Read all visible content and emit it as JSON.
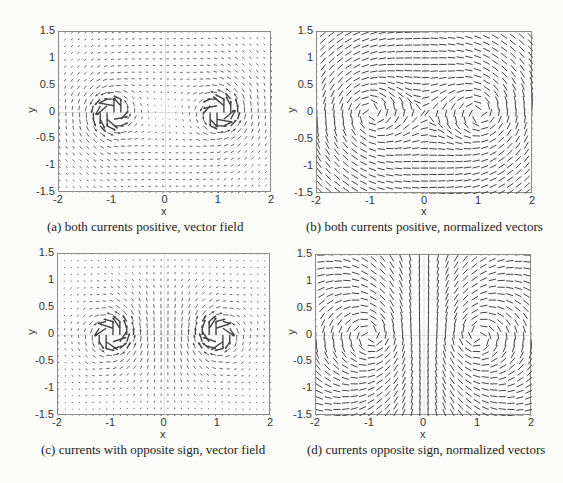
{
  "chart_data": [
    {
      "id": "a",
      "type": "quiver",
      "caption": "(a) both currents positive, vector field",
      "normalized": false,
      "currents": [
        {
          "x": -1,
          "y": 0,
          "sign": 1
        },
        {
          "x": 1,
          "y": 0,
          "sign": 1
        }
      ],
      "xlabel": "x",
      "ylabel": "y",
      "xlim": [
        -2,
        2
      ],
      "ylim": [
        -1.5,
        1.5
      ],
      "xticks": [
        "-2",
        "-1",
        "0",
        "1",
        "2"
      ],
      "yticks": [
        "1.5",
        "1",
        "0.5",
        "0",
        "-0.5",
        "-1",
        "-1.5"
      ],
      "grid": "zero-lines",
      "grid_n": [
        31,
        24
      ],
      "rotation": "counter-clockwise"
    },
    {
      "id": "b",
      "type": "quiver",
      "caption": "(b) both currents positive, normalized vectors",
      "normalized": true,
      "currents": [
        {
          "x": -1,
          "y": 0,
          "sign": 1
        },
        {
          "x": 1,
          "y": 0,
          "sign": 1
        }
      ],
      "xlabel": "x",
      "ylabel": "y",
      "xlim": [
        -2,
        2
      ],
      "ylim": [
        -1.5,
        1.5
      ],
      "xticks": [
        "-2",
        "-1",
        "0",
        "1",
        "2"
      ],
      "yticks": [
        "1.5",
        "1",
        "0.5",
        "0",
        "-0.5",
        "-1",
        "-1.5"
      ],
      "grid": "zero-lines",
      "grid_n": [
        25,
        25
      ],
      "rotation": "counter-clockwise"
    },
    {
      "id": "c",
      "type": "quiver",
      "caption": "(c) currents with opposite sign, vector field",
      "normalized": false,
      "currents": [
        {
          "x": -1,
          "y": 0,
          "sign": 1
        },
        {
          "x": 1,
          "y": 0,
          "sign": -1
        }
      ],
      "xlabel": "x",
      "ylabel": "y",
      "xlim": [
        -2,
        2
      ],
      "ylim": [
        -1.5,
        1.5
      ],
      "xticks": [
        "-2",
        "-1",
        "0",
        "1",
        "2"
      ],
      "yticks": [
        "1.5",
        "1",
        "0.5",
        "0",
        "-0.5",
        "-1",
        "-1.5"
      ],
      "grid": "zero-lines",
      "grid_n": [
        31,
        24
      ],
      "rotation": "opposite"
    },
    {
      "id": "d",
      "type": "quiver",
      "caption": "(d) currents opposite sign, normalized vectors",
      "normalized": true,
      "currents": [
        {
          "x": -1,
          "y": 0,
          "sign": 1
        },
        {
          "x": 1,
          "y": 0,
          "sign": -1
        }
      ],
      "xlabel": "x",
      "ylabel": "y",
      "xlim": [
        -2,
        2
      ],
      "ylim": [
        -1.5,
        1.5
      ],
      "xticks": [
        "-2",
        "-1",
        "0",
        "1",
        "2"
      ],
      "yticks": [
        "1.5",
        "1",
        "0.5",
        "0",
        "-0.5",
        "-1",
        "-1.5"
      ],
      "grid": "zero-lines",
      "grid_n": [
        25,
        25
      ],
      "rotation": "opposite"
    }
  ],
  "colors": {
    "arrow": "#444444",
    "frame": "#8a8a8a",
    "grid": "#d8d8d8"
  }
}
